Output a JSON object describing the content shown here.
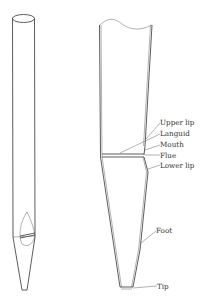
{
  "diagram": {
    "left_figure": "whole pipe (perspective view)",
    "right_figure": "detail of pipe lower section",
    "labels": [
      {
        "id": "upper-lip",
        "text": "Upper lip"
      },
      {
        "id": "languid",
        "text": "Languid"
      },
      {
        "id": "mouth",
        "text": "Mouth"
      },
      {
        "id": "flue",
        "text": "Flue"
      },
      {
        "id": "lower-lip",
        "text": "Lower lip"
      },
      {
        "id": "foot",
        "text": "Foot"
      },
      {
        "id": "tip",
        "text": "Tip"
      }
    ]
  }
}
